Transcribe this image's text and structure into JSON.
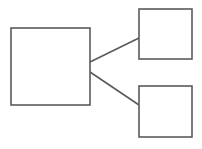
{
  "diagram": {
    "title": "",
    "background_color": "#ffffff",
    "stroke_color": "#5a5a5a",
    "fill_color": "#ffffff",
    "stroke_width": 1.6,
    "nodes": [
      {
        "id": "node-main",
        "name": "large-left-rectangle",
        "label": "",
        "x": 11,
        "y": 28,
        "width": 79,
        "height": 77
      },
      {
        "id": "node-top-right",
        "name": "small-top-right-rectangle",
        "label": "",
        "x": 139,
        "y": 9,
        "width": 53,
        "height": 50
      },
      {
        "id": "node-bottom-right",
        "name": "small-bottom-right-rectangle",
        "label": "",
        "x": 139,
        "y": 86,
        "width": 53,
        "height": 51
      }
    ],
    "connectors": [
      {
        "id": "edge-main-to-top-right",
        "name": "connector-main-to-top-right",
        "from": "node-main",
        "to": "node-top-right",
        "x1": 90,
        "y1": 62,
        "x2": 139,
        "y2": 38
      },
      {
        "id": "edge-main-to-bottom-right",
        "name": "connector-main-to-bottom-right",
        "from": "node-main",
        "to": "node-bottom-right",
        "x1": 90,
        "y1": 72,
        "x2": 139,
        "y2": 105
      }
    ]
  }
}
